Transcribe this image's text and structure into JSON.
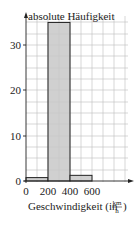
{
  "chart_data": {
    "type": "bar",
    "title": "",
    "ylabel": "absolute Häufigkeit",
    "xlabel": "Geschwindigkeit (in km/h)",
    "xlabel_text": "Geschwindigkeit (in",
    "xlabel_unit_num": "km",
    "xlabel_unit_den": "h",
    "categories": [
      "0-200",
      "200-400",
      "400-600"
    ],
    "bins": [
      [
        0,
        200
      ],
      [
        200,
        400
      ],
      [
        400,
        600
      ]
    ],
    "values": [
      0.75,
      35,
      1.25
    ],
    "x_ticks": [
      "0",
      "200",
      "400",
      "600"
    ],
    "y_ticks": [
      "0",
      "10",
      "20",
      "30"
    ],
    "xlim": [
      0,
      1000
    ],
    "ylim": [
      0,
      36
    ],
    "grid": true,
    "bar_color": "#c8c8c8",
    "legend": null
  }
}
